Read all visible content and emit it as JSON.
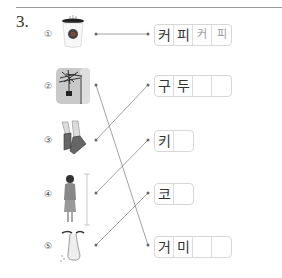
{
  "question": {
    "number": "3."
  },
  "items": [
    {
      "marker": "①",
      "picture": "coffee-cup"
    },
    {
      "marker": "②",
      "picture": "spider"
    },
    {
      "marker": "③",
      "picture": "shoes"
    },
    {
      "marker": "④",
      "picture": "tall-woman"
    },
    {
      "marker": "⑤",
      "picture": "nose"
    }
  ],
  "answers": [
    {
      "cells": [
        "커",
        "피",
        "커",
        "피"
      ],
      "trace": [
        false,
        false,
        true,
        true
      ]
    },
    {
      "cells": [
        "구",
        "두",
        "",
        ""
      ]
    },
    {
      "cells": [
        "키",
        ""
      ]
    },
    {
      "cells": [
        "코",
        ""
      ]
    },
    {
      "cells": [
        "거",
        "미",
        "",
        ""
      ]
    }
  ],
  "connections": [
    {
      "from": "①",
      "to": "커피"
    },
    {
      "from": "②",
      "to": "거미"
    },
    {
      "from": "③",
      "to": "구두"
    },
    {
      "from": "④",
      "to": "키"
    },
    {
      "from": "⑤",
      "to": "코"
    }
  ],
  "colors": {
    "line": "#8a8a8a",
    "text": "#333333",
    "trace_text": "#9a9a9a",
    "box_border": "#d7d7d7"
  }
}
